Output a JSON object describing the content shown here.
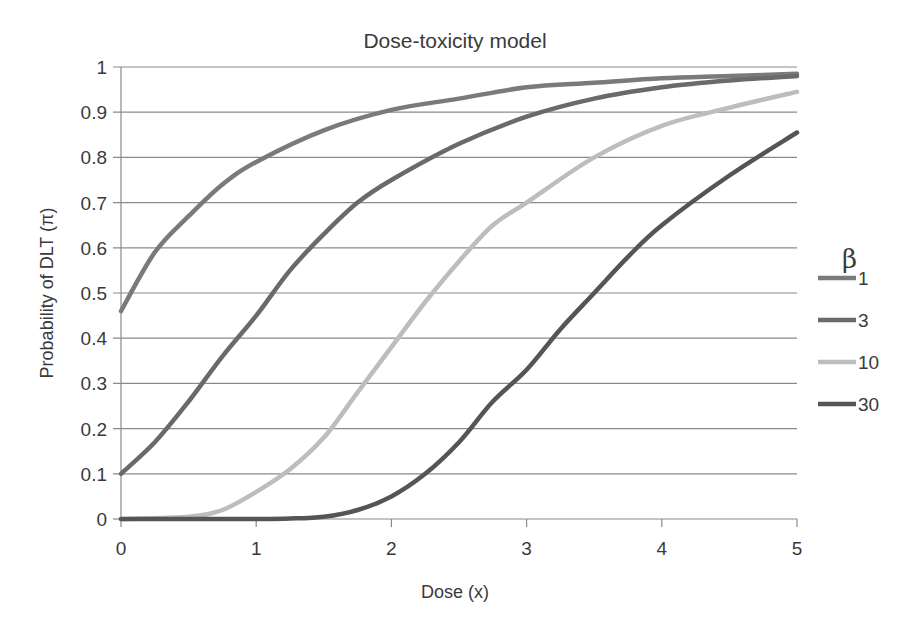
{
  "chart_data": {
    "type": "line",
    "title": "Dose-toxicity model",
    "xlabel": "Dose (x)",
    "ylabel": "Probability of DLT (π)",
    "xlim": [
      0,
      5
    ],
    "ylim": [
      0,
      1
    ],
    "xticks": [
      "0",
      "1",
      "2",
      "3",
      "4",
      "5"
    ],
    "yticks": [
      "0",
      "0.1",
      "0.2",
      "0.3",
      "0.4",
      "0.5",
      "0.6",
      "0.7",
      "0.8",
      "0.9",
      "1"
    ],
    "grid": {
      "horizontal": true,
      "vertical": false
    },
    "legend": {
      "title": "β",
      "position": "right"
    },
    "series": [
      {
        "name": "1",
        "color": "#7a7a7a",
        "x": [
          0,
          0.25,
          0.5,
          0.75,
          1,
          1.5,
          2,
          2.5,
          3,
          3.5,
          4,
          4.5,
          5
        ],
        "y": [
          0.46,
          0.59,
          0.67,
          0.74,
          0.79,
          0.86,
          0.905,
          0.93,
          0.955,
          0.965,
          0.975,
          0.98,
          0.985
        ]
      },
      {
        "name": "3",
        "color": "#6a6a6a",
        "x": [
          0,
          0.25,
          0.5,
          0.75,
          1,
          1.25,
          1.5,
          1.75,
          2,
          2.5,
          3,
          3.5,
          4,
          4.5,
          5
        ],
        "y": [
          0.1,
          0.17,
          0.26,
          0.36,
          0.45,
          0.55,
          0.63,
          0.7,
          0.75,
          0.83,
          0.89,
          0.93,
          0.955,
          0.97,
          0.98
        ]
      },
      {
        "name": "10",
        "color": "#bdbdbd",
        "x": [
          0,
          0.5,
          0.75,
          1,
          1.25,
          1.5,
          1.75,
          2,
          2.25,
          2.5,
          2.75,
          3,
          3.5,
          4,
          4.5,
          5
        ],
        "y": [
          0.0,
          0.005,
          0.02,
          0.06,
          0.11,
          0.18,
          0.28,
          0.38,
          0.48,
          0.57,
          0.65,
          0.7,
          0.8,
          0.87,
          0.91,
          0.945
        ]
      },
      {
        "name": "30",
        "color": "#555555",
        "x": [
          0,
          0.5,
          1,
          1.25,
          1.5,
          1.75,
          2,
          2.25,
          2.5,
          2.75,
          3,
          3.25,
          3.5,
          3.75,
          4,
          4.5,
          5
        ],
        "y": [
          0.0,
          0.0,
          0.0,
          0.001,
          0.005,
          0.02,
          0.05,
          0.1,
          0.17,
          0.26,
          0.33,
          0.42,
          0.5,
          0.58,
          0.65,
          0.76,
          0.855
        ]
      }
    ]
  }
}
